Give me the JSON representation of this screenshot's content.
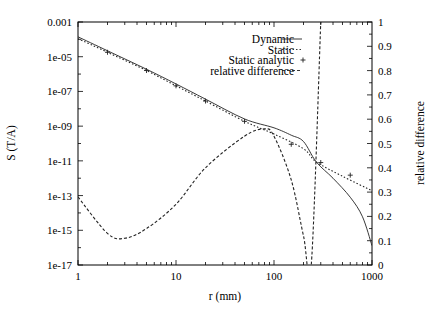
{
  "chart_data": {
    "type": "line",
    "title": "",
    "xlabel": "r (mm)",
    "ylabel": "S (T/A)",
    "y2label": "relative difference",
    "xscale": "log",
    "yscale": "log",
    "xlim": [
      1,
      1000
    ],
    "ylim": [
      1e-17,
      0.001
    ],
    "y2lim": [
      0,
      1
    ],
    "grid": false,
    "legend_position": "upper right (inside)",
    "x_ticks": [
      "1",
      "10",
      "100",
      "1000"
    ],
    "y_ticks": [
      "0.001",
      "1e-05",
      "1e-07",
      "1e-09",
      "1e-11",
      "1e-13",
      "1e-15",
      "1e-17"
    ],
    "y2_ticks": [
      "0",
      "0.1",
      "0.2",
      "0.3",
      "0.4",
      "0.5",
      "0.6",
      "0.7",
      "0.8",
      "0.9",
      "1"
    ],
    "series": [
      {
        "name": "Dynamic",
        "style": "solid",
        "axis": "left",
        "x": [
          1,
          2,
          5,
          10,
          20,
          50,
          100,
          150,
          200,
          270,
          400,
          600,
          800,
          1000
        ],
        "y": [
          0.00014,
          2.2e-05,
          1.9e-06,
          2.7e-07,
          3.6e-08,
          2.6e-09,
          8e-10,
          3e-10,
          1.3e-10,
          8.7e-12,
          1e-12,
          8e-14,
          6e-15,
          1.3e-16
        ]
      },
      {
        "name": "Static",
        "style": "dotted",
        "axis": "left",
        "x": [
          1,
          2,
          5,
          10,
          20,
          50,
          100,
          200,
          270,
          500,
          1000
        ],
        "y": [
          0.00011,
          1.8e-05,
          1.6e-06,
          2.1e-07,
          2.8e-08,
          1.9e-09,
          3.5e-10,
          5e-11,
          8.7e-12,
          1.3e-12,
          1.9e-13
        ]
      },
      {
        "name": "Static analytic",
        "style": "markers (+)",
        "axis": "left",
        "x": [
          2,
          5,
          10,
          20,
          50,
          150,
          300,
          600
        ],
        "y": [
          1.8e-05,
          1.6e-06,
          2.1e-07,
          2.8e-08,
          1.9e-09,
          9e-11,
          8e-12,
          1.5e-12
        ]
      },
      {
        "name": "relative difference",
        "style": "dashed",
        "axis": "right",
        "x": [
          1,
          2,
          3,
          5,
          10,
          20,
          50,
          80,
          100,
          150,
          200,
          240,
          300
        ],
        "y": [
          0.28,
          0.13,
          0.11,
          0.15,
          0.25,
          0.4,
          0.53,
          0.56,
          0.53,
          0.35,
          0.12,
          0.0,
          1.0
        ]
      }
    ]
  },
  "legend": {
    "items": [
      {
        "label": "Dynamic",
        "style": "solid"
      },
      {
        "label": "Static",
        "style": "dotted"
      },
      {
        "label": "Static analytic",
        "style": "plus"
      },
      {
        "label": "relative difference",
        "style": "dashed"
      }
    ]
  },
  "axes": {
    "xlabel": "r (mm)",
    "ylabel": "S (T/A)",
    "y2label": "relative difference",
    "x_tick_labels": [
      "1",
      "10",
      "100",
      "1000"
    ],
    "y_tick_labels": [
      "0.001",
      "1e-05",
      "1e-07",
      "1e-09",
      "1e-11",
      "1e-13",
      "1e-15",
      "1e-17"
    ],
    "y2_tick_labels": [
      "0",
      "0.1",
      "0.2",
      "0.3",
      "0.4",
      "0.5",
      "0.6",
      "0.7",
      "0.8",
      "0.9",
      "1"
    ]
  },
  "colors": {
    "line": "#222222",
    "axis": "#000000",
    "background": "#ffffff"
  }
}
